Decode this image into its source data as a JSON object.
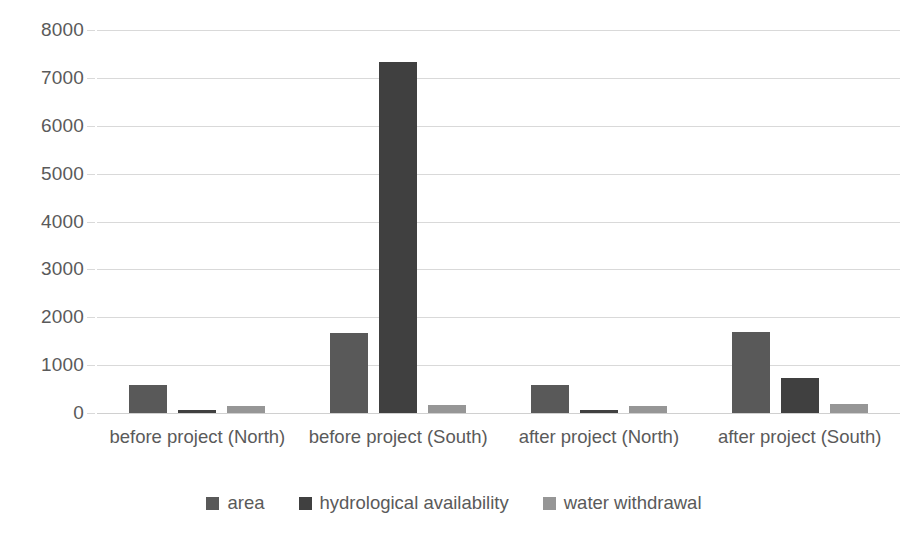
{
  "chart_data": {
    "type": "bar",
    "title": "",
    "subtitle": "",
    "xlabel": "",
    "ylabel": "",
    "ylim": [
      0,
      8000
    ],
    "ytick_step": 1000,
    "yticks": [
      "8000",
      "7000",
      "6000",
      "5000",
      "4000",
      "3000",
      "2000",
      "1000",
      "0"
    ],
    "grid": true,
    "legend_position": "bottom",
    "categories": [
      "before project (North)",
      "before project (South)",
      "after project (North)",
      "after project (South)"
    ],
    "series": [
      {
        "name": "area",
        "color": "#595959",
        "values": [
          585,
          1680,
          585,
          1700
        ]
      },
      {
        "name": "hydrological availability",
        "color": "#404040",
        "values": [
          55,
          7330,
          55,
          730
        ]
      },
      {
        "name": "water withdrawal",
        "color": "#969696",
        "values": [
          145,
          165,
          145,
          190
        ]
      }
    ]
  },
  "axis": {
    "grid_color": "#d9d9d9",
    "label_color": "#5a5a5a"
  }
}
